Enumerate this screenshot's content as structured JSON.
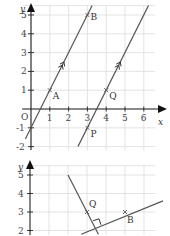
{
  "graphs": [
    {
      "id": "graph-parallel",
      "x_label": "x",
      "y_label": "y",
      "origin_label": "O",
      "x_range": [
        -0.5,
        6.5
      ],
      "y_range": [
        -2,
        5.5
      ],
      "x_ticks": [
        "1",
        "2",
        "3",
        "4",
        "5",
        "6"
      ],
      "y_ticks": [
        "-2",
        "-1",
        "1",
        "2",
        "3",
        "4",
        "5"
      ],
      "lines": [
        {
          "name": "line-AB",
          "from": [
            -0.3,
            -1.6
          ],
          "to": [
            3.25,
            5.5
          ],
          "arrow_at": [
            1.75,
            2.5
          ]
        },
        {
          "name": "line-PQ",
          "from": [
            2.5,
            -2
          ],
          "to": [
            6.25,
            5.5
          ],
          "arrow_at": [
            4.75,
            2.5
          ]
        }
      ],
      "points": [
        {
          "label": "A",
          "x": 1,
          "y": 1
        },
        {
          "label": "B",
          "x": 3,
          "y": 5
        },
        {
          "label": "Q",
          "x": 4,
          "y": 1
        },
        {
          "label": "P",
          "x": 3,
          "y": -1
        }
      ]
    },
    {
      "id": "graph-perpendicular",
      "y_label": "y",
      "y_ticks": [
        "2",
        "3",
        "4",
        "5"
      ],
      "lines": [
        {
          "name": "line-through-B",
          "from": [
            2.7,
            1.8
          ],
          "to": [
            7,
            3.6
          ]
        },
        {
          "name": "line-perpendicular",
          "from": [
            2,
            5
          ],
          "to": [
            3.6,
            1.8
          ]
        }
      ],
      "points": [
        {
          "label": "Q",
          "x": 3,
          "y": 3
        },
        {
          "label": "B",
          "x": 5,
          "y": 3
        }
      ],
      "right_angle_marker": true
    }
  ]
}
